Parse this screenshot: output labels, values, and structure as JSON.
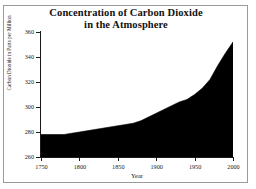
{
  "figure": {
    "title_lines": [
      "Concentration of Carbon Dioxide",
      "in the Atmosphere"
    ],
    "frame_color": "#9a9a9a",
    "background_color": "#ffffff",
    "axis_color": "#1a1a1a"
  },
  "chart_data": {
    "type": "area",
    "title": "Concentration of Carbon Dioxide in the Atmosphere",
    "xlabel": "Year",
    "ylabel": "Carbon Dioxide in Parts per Million",
    "xlim": [
      1750,
      2000
    ],
    "ylim": [
      260,
      360
    ],
    "grid": false,
    "legend": null,
    "fill_color": "#000000",
    "line_color": "#000000",
    "xticks": [
      1750,
      1800,
      1850,
      1900,
      1950,
      2000
    ],
    "xtick_labels": [
      "1750",
      "1800",
      "1850",
      "1900",
      "1950",
      "2000"
    ],
    "yticks": [
      260,
      280,
      300,
      320,
      340,
      360
    ],
    "ytick_labels": [
      "260",
      "280",
      "300",
      "320",
      "340",
      "360"
    ],
    "series": [
      {
        "name": "Carbon Dioxide",
        "x": [
          1750,
          1760,
          1770,
          1780,
          1790,
          1800,
          1810,
          1820,
          1830,
          1840,
          1850,
          1860,
          1870,
          1880,
          1890,
          1900,
          1910,
          1920,
          1930,
          1940,
          1950,
          1960,
          1970,
          1980,
          1990,
          2000
        ],
        "values": [
          278,
          278,
          278,
          278,
          279,
          280,
          281,
          282,
          283,
          284,
          285,
          286,
          287,
          289,
          292,
          295,
          298,
          301,
          304,
          306,
          310,
          315,
          322,
          333,
          343,
          352
        ]
      }
    ]
  }
}
